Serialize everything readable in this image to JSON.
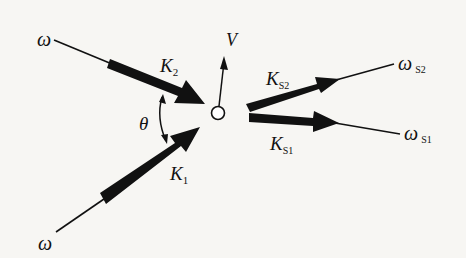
{
  "diagram": {
    "type": "wave-vector interaction diagram",
    "labels": {
      "omega_top": "ω",
      "omega_bottom": "ω",
      "k2": "K",
      "k2_sub": "2",
      "k1": "K",
      "k1_sub": "1",
      "theta": "θ",
      "v": "V",
      "ks2": "K",
      "ks2_sub": "S2",
      "ks1": "K",
      "ks1_sub": "S1",
      "omega_s2": "ω",
      "omega_s2_sub": "S2",
      "omega_s1": "ω",
      "omega_s1_sub": "S1"
    },
    "colors": {
      "ink": "#111111",
      "background": "#f7f6f3"
    }
  }
}
